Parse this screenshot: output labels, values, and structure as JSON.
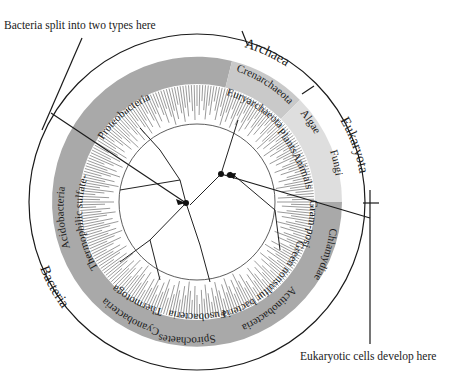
{
  "diagram": {
    "center": {
      "x": 197,
      "y": 202
    },
    "colors": {
      "bacteria_band": "#a9a9a9",
      "archaea_band": "#c9c9c9",
      "eukaryota_band": "#dedede",
      "line": "#1a1a1a",
      "background": "#ffffff"
    },
    "callouts": {
      "top_left": "Bacteria split into two types here",
      "bottom_right": "Eukaryotic cells develop here"
    },
    "domains": [
      {
        "name": "Archaea",
        "label": "Archaea"
      },
      {
        "name": "Eukaryota",
        "label": "Eukaryota"
      },
      {
        "name": "Bacteria",
        "label": "Bacteria"
      }
    ],
    "groups": {
      "archaea": [
        "Crenarchaeota",
        "Euryarchaeota"
      ],
      "eukaryota": [
        "Algae",
        "Plants",
        "Animals",
        "Fungi"
      ],
      "bacteria": [
        "Proteobacteria",
        "Acidobacteria",
        "Thermophilic sulfate-reducers",
        "Thermotoga",
        "Cyanobacteria",
        "Fusobacteria",
        "Spirochaetes",
        "Green nonsulfur bacteria",
        "Actinobacteria",
        "Chlamydiae",
        "Gram-positives"
      ]
    }
  }
}
